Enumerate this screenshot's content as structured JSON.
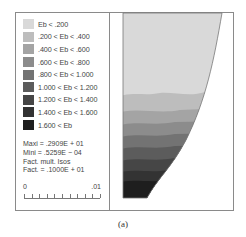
{
  "figure": {
    "caption": "(a)",
    "legend": {
      "items": [
        {
          "label": "Eb < .200",
          "color": "#d9d9d9"
        },
        {
          "label": ".200 < Eb < .400",
          "color": "#bdbdbd"
        },
        {
          "label": ".400 < Eb < .600",
          "color": "#a4a4a4"
        },
        {
          "label": ".600 < Eb < .800",
          "color": "#8c8c8c"
        },
        {
          "label": ".800 < Eb < 1.000",
          "color": "#737373"
        },
        {
          "label": "1.000 < Eb < 1.200",
          "color": "#5c5c5c"
        },
        {
          "label": "1.200 < Eb < 1.400",
          "color": "#464646"
        },
        {
          "label": "1.400 < Eb < 1.600",
          "color": "#333333"
        },
        {
          "label": "1.600 < Eb",
          "color": "#1e1e1e"
        }
      ]
    },
    "stats": {
      "maxi": "Maxi = .2909E + 01",
      "mini": "Mini  = .5259E − 04",
      "fact_mult": "Fact. mult. Isos",
      "fact": "Fact. = .1000E + 01"
    },
    "scale_bar": {
      "left_label": "0",
      "right_label": ".01",
      "ticks": 11
    },
    "contour_plot": {
      "bands_top_to_bottom": [
        "#d9d9d9",
        "#bdbdbd",
        "#a4a4a4",
        "#8c8c8c",
        "#737373",
        "#5c5c5c",
        "#464646",
        "#333333",
        "#1e1e1e"
      ]
    }
  }
}
